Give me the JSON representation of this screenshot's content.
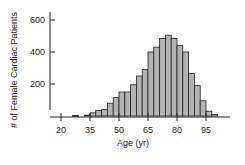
{
  "chart_data": {
    "type": "bar",
    "title": "",
    "xlabel": "Age (yr)",
    "ylabel": "# of Female Cardiac Patients",
    "x_ticks": [
      20,
      35,
      50,
      65,
      80,
      95
    ],
    "y_ticks": [
      200,
      400,
      600
    ],
    "xlim": [
      15,
      105
    ],
    "ylim": [
      0,
      620
    ],
    "bin_width": 3,
    "bins_start": [
      26,
      32,
      35,
      38,
      41,
      44,
      47,
      50,
      53,
      56,
      59,
      62,
      65,
      68,
      71,
      74,
      77,
      80,
      83,
      86,
      89,
      92,
      95,
      98
    ],
    "values": [
      3,
      5,
      20,
      35,
      40,
      80,
      115,
      150,
      150,
      195,
      250,
      290,
      400,
      430,
      485,
      505,
      485,
      440,
      400,
      265,
      190,
      95,
      30,
      10
    ],
    "bar_color": "#b3b3b3",
    "edge_color": "#222222",
    "grid": false
  }
}
